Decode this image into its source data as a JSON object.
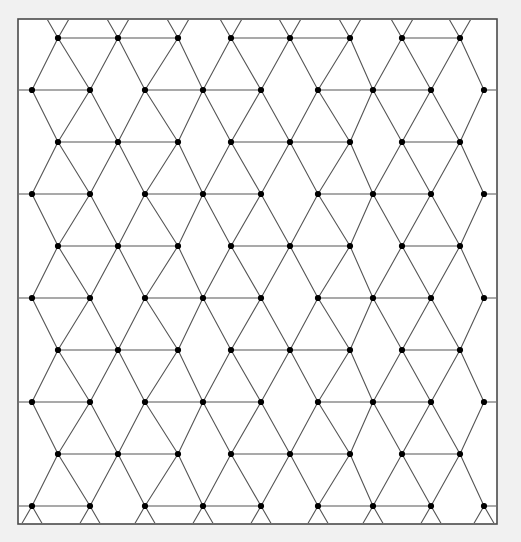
{
  "figure": {
    "type": "lattice-diagram",
    "canvas": {
      "width": 521,
      "height": 542
    },
    "background_color": "#f1f1f1",
    "plot_background_color": "#ffffff"
  },
  "frame": {
    "name": "outer-border",
    "x": 18,
    "y": 19,
    "width": 479,
    "height": 505,
    "stroke_color": "#4a4a4a",
    "stroke_width": 1.6,
    "fill": "#ffffff"
  },
  "lattice": {
    "description": "Planar lattice of vertices joined by straight edges forming rhombi and triangles, clipped to a rectangular frame.",
    "edge_color": "#555555",
    "edge_width": 1.1,
    "node_color": "#000000",
    "node_radius": 3.1,
    "geometry": {
      "row_pitch": 52,
      "column_pitch": 60,
      "a_row_x_start": 58,
      "a_row_x_values": [
        58,
        118,
        178,
        231,
        290,
        350,
        402,
        460
      ],
      "b_row_x_values": [
        32,
        90,
        145,
        203,
        261,
        318,
        373,
        431,
        484
      ],
      "a_row_y_values": [
        38,
        142,
        246,
        350,
        454
      ],
      "b_row_y_values": [
        90,
        194,
        298,
        402,
        506
      ],
      "triangle_half_width": 30,
      "rhombus_half_height": 52
    },
    "node_rows": [
      {
        "name": "row-a-1",
        "y": 38,
        "x": [
          58,
          118,
          178,
          231,
          290,
          350,
          402,
          460
        ]
      },
      {
        "name": "row-b-1",
        "y": 90,
        "x": [
          32,
          90,
          145,
          203,
          261,
          318,
          373,
          431,
          484
        ]
      },
      {
        "name": "row-a-2",
        "y": 142,
        "x": [
          58,
          118,
          178,
          231,
          290,
          350,
          402,
          460
        ]
      },
      {
        "name": "row-b-2",
        "y": 194,
        "x": [
          32,
          90,
          145,
          203,
          261,
          318,
          373,
          431,
          484
        ]
      },
      {
        "name": "row-a-3",
        "y": 246,
        "x": [
          58,
          118,
          178,
          231,
          290,
          350,
          402,
          460
        ]
      },
      {
        "name": "row-b-3",
        "y": 298,
        "x": [
          32,
          90,
          145,
          203,
          261,
          318,
          373,
          431,
          484
        ]
      },
      {
        "name": "row-a-4",
        "y": 350,
        "x": [
          58,
          118,
          178,
          231,
          290,
          350,
          402,
          460
        ]
      },
      {
        "name": "row-b-4",
        "y": 402,
        "x": [
          32,
          90,
          145,
          203,
          261,
          318,
          373,
          431,
          484
        ]
      },
      {
        "name": "row-a-5",
        "y": 454,
        "x": [
          58,
          118,
          178,
          231,
          290,
          350,
          402,
          460
        ]
      },
      {
        "name": "row-b-5",
        "y": 506,
        "x": [
          32,
          90,
          145,
          203,
          261,
          318,
          373,
          431,
          484
        ]
      }
    ],
    "horizontal_edge_runs": {
      "description": "Within each row, consecutive nodes are joined horizontally except across the wide rhombus gaps.",
      "a_row_pairs": [
        [
          0,
          1
        ],
        [
          1,
          2
        ],
        [
          3,
          4
        ],
        [
          4,
          5
        ],
        [
          6,
          7
        ]
      ],
      "b_row_pairs": [
        [
          0,
          1
        ],
        [
          2,
          3
        ],
        [
          3,
          4
        ],
        [
          5,
          6
        ],
        [
          6,
          7
        ]
      ]
    },
    "counts": {
      "rows": 10,
      "nodes_total": 85
    }
  }
}
